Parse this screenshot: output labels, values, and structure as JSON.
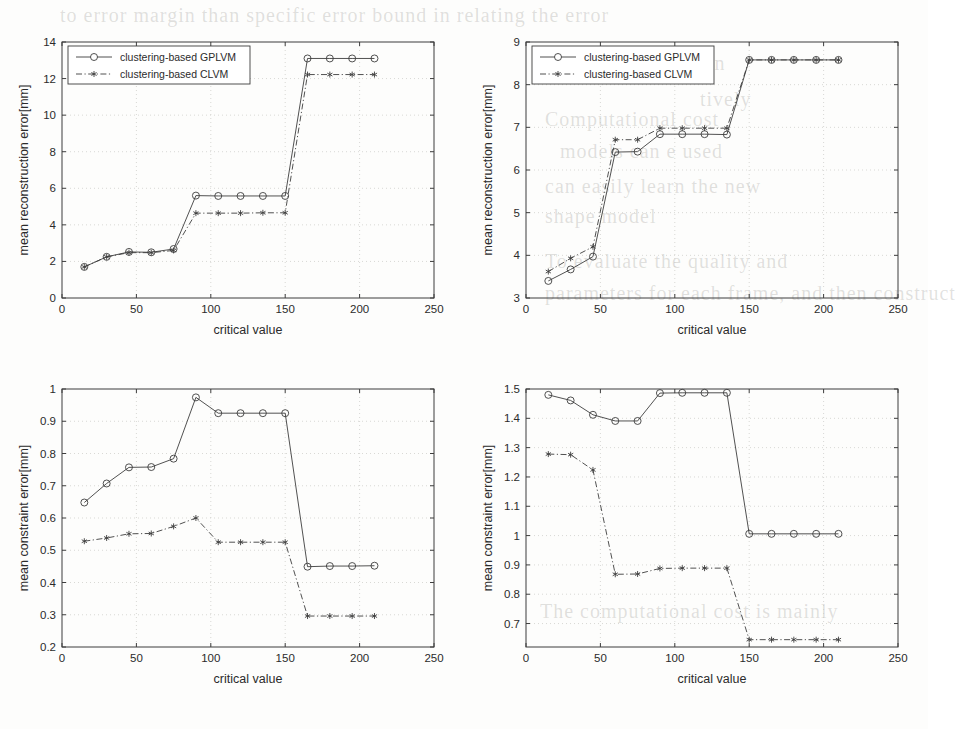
{
  "figure": {
    "kind": "scanned-paper-figure",
    "panel_count": 4,
    "background_text": [
      "to error margin than specific error bound in relating the error",
      "in the reconstruction",
      "tively",
      "models can e used",
      "can easily learn the new",
      "shape model",
      "To evaluate the quality and",
      "parameters for each frame, and then construct",
      "Computational cost",
      "The computational cost is mainly"
    ]
  },
  "legend": {
    "gplvm_label": "clustering-based GPLVM",
    "clvm_label": "clustering-based CLVM",
    "gplvm_marker": "circle-marker",
    "clvm_marker": "asterisk-marker",
    "gplvm_color": "#3a3a3a",
    "clvm_color": "#3a3a3a"
  },
  "chart_data": [
    {
      "id": "top-left",
      "type": "line",
      "title": "",
      "xlabel": "critical value",
      "ylabel": "mean reconstruction error[mm]",
      "xlim": [
        0,
        250
      ],
      "ylim": [
        0,
        14
      ],
      "xticks": [
        0,
        50,
        100,
        150,
        200,
        250
      ],
      "yticks": [
        0,
        2,
        4,
        6,
        8,
        10,
        12,
        14
      ],
      "grid": true,
      "legend_position": "top-left",
      "x": [
        15,
        30,
        45,
        60,
        75,
        90,
        105,
        120,
        135,
        150,
        165,
        180,
        195,
        210
      ],
      "series": [
        {
          "name": "clustering-based GPLVM",
          "marker": "circle-marker",
          "linestyle": "solid",
          "values": [
            1.7,
            2.25,
            2.52,
            2.5,
            2.68,
            5.6,
            5.58,
            5.58,
            5.58,
            5.58,
            13.1,
            13.1,
            13.1,
            13.1
          ]
        },
        {
          "name": "clustering-based CLVM",
          "marker": "asterisk-marker",
          "linestyle": "dashdot",
          "values": [
            1.7,
            2.25,
            2.48,
            2.48,
            2.6,
            4.64,
            4.64,
            4.64,
            4.66,
            4.66,
            12.22,
            12.22,
            12.22,
            12.22
          ]
        }
      ]
    },
    {
      "id": "top-right",
      "type": "line",
      "title": "",
      "xlabel": "critical value",
      "ylabel": "mean reconstruction error[mm]",
      "xlim": [
        0,
        250
      ],
      "ylim": [
        3,
        9
      ],
      "xticks": [
        0,
        50,
        100,
        150,
        200,
        250
      ],
      "yticks": [
        3,
        4,
        5,
        6,
        7,
        8,
        9
      ],
      "grid": true,
      "legend_position": "top-left",
      "x": [
        15,
        30,
        45,
        60,
        75,
        90,
        105,
        120,
        135,
        150,
        165,
        180,
        195,
        210
      ],
      "series": [
        {
          "name": "clustering-based GPLVM",
          "marker": "circle-marker",
          "linestyle": "solid",
          "values": [
            3.4,
            3.67,
            3.97,
            6.42,
            6.43,
            6.84,
            6.84,
            6.84,
            6.83,
            8.58,
            8.58,
            8.58,
            8.58,
            8.58
          ]
        },
        {
          "name": "clustering-based CLVM",
          "marker": "asterisk-marker",
          "linestyle": "dashdot",
          "values": [
            3.62,
            3.93,
            4.2,
            6.71,
            6.71,
            6.98,
            6.98,
            6.98,
            6.98,
            8.58,
            8.58,
            8.58,
            8.58,
            8.58
          ]
        }
      ]
    },
    {
      "id": "bottom-left",
      "type": "line",
      "title": "",
      "xlabel": "critical value",
      "ylabel": "mean constraint error[mm]",
      "xlim": [
        0,
        250
      ],
      "ylim": [
        0.2,
        1.0
      ],
      "xticks": [
        0,
        50,
        100,
        150,
        200,
        250
      ],
      "yticks": [
        0.2,
        0.3,
        0.4,
        0.5,
        0.6,
        0.7,
        0.8,
        0.9,
        1
      ],
      "ytick_labels": [
        "0.2",
        "0.3",
        "0.4",
        "0.5",
        "0.6",
        "0.7",
        "0.8",
        "0.9",
        "1"
      ],
      "grid": true,
      "legend_position": "none",
      "x": [
        15,
        30,
        45,
        60,
        75,
        90,
        105,
        120,
        135,
        150,
        165,
        180,
        195,
        210
      ],
      "series": [
        {
          "name": "clustering-based GPLVM",
          "marker": "circle-marker",
          "linestyle": "solid",
          "values": [
            0.648,
            0.707,
            0.757,
            0.758,
            0.784,
            0.974,
            0.925,
            0.925,
            0.925,
            0.925,
            0.449,
            0.451,
            0.451,
            0.452
          ]
        },
        {
          "name": "clustering-based CLVM",
          "marker": "asterisk-marker",
          "linestyle": "dashdot",
          "values": [
            0.528,
            0.538,
            0.551,
            0.552,
            0.574,
            0.6,
            0.525,
            0.525,
            0.525,
            0.525,
            0.296,
            0.296,
            0.296,
            0.296
          ]
        }
      ]
    },
    {
      "id": "bottom-right",
      "type": "line",
      "title": "",
      "xlabel": "critical value",
      "ylabel": "mean constraint error[mm]",
      "xlim": [
        0,
        250
      ],
      "ylim": [
        0.62,
        1.5
      ],
      "xticks": [
        0,
        50,
        100,
        150,
        200,
        250
      ],
      "yticks": [
        0.7,
        0.8,
        0.9,
        1,
        1.1,
        1.2,
        1.3,
        1.4,
        1.5
      ],
      "ytick_labels": [
        "0.7",
        "0.8",
        "0.9",
        "1",
        "1.1",
        "1.2",
        "1.3",
        "1.4",
        "1.5"
      ],
      "grid": true,
      "legend_position": "none",
      "x": [
        15,
        30,
        45,
        60,
        75,
        90,
        105,
        120,
        135,
        150,
        165,
        180,
        195,
        210
      ],
      "series": [
        {
          "name": "clustering-based GPLVM",
          "marker": "circle-marker",
          "linestyle": "solid",
          "values": [
            1.48,
            1.461,
            1.412,
            1.391,
            1.391,
            1.486,
            1.487,
            1.487,
            1.487,
            1.006,
            1.006,
            1.006,
            1.006,
            1.006
          ]
        },
        {
          "name": "clustering-based CLVM",
          "marker": "asterisk-marker",
          "linestyle": "dashdot",
          "values": [
            1.278,
            1.276,
            1.224,
            0.868,
            0.869,
            0.888,
            0.889,
            0.889,
            0.889,
            0.645,
            0.645,
            0.645,
            0.645,
            0.645
          ]
        }
      ]
    }
  ]
}
